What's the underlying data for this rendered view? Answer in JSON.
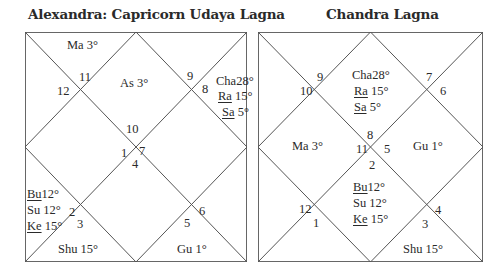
{
  "left_chart": {
    "title": "Alexandra: Capricorn Udaya Lagna",
    "house_numbers": {
      "h1": "10",
      "h2": "11",
      "h3": "12",
      "h4": "1",
      "h5": "2",
      "h6": "3",
      "h7": "4",
      "h8": "5",
      "h9": "6",
      "h10": "7",
      "h11": "8",
      "h12": "9"
    },
    "planets": {
      "ma": {
        "name": "Ma",
        "deg": "3°"
      },
      "as": {
        "name": "As",
        "deg": "3°"
      },
      "cha": {
        "name": "Cha",
        "deg": "28°"
      },
      "ra": {
        "name": "Ra",
        "deg": "15°"
      },
      "sa": {
        "name": "Sa",
        "deg": "5°"
      },
      "bu": {
        "name": "Bu",
        "deg": "12°"
      },
      "su": {
        "name": "Su",
        "deg": "12°"
      },
      "ke": {
        "name": "Ke",
        "deg": "15°"
      },
      "shu": {
        "name": "Shu",
        "deg": "15°"
      },
      "gu": {
        "name": "Gu",
        "deg": "1°"
      }
    }
  },
  "right_chart": {
    "title": "Chandra Lagna",
    "house_numbers": {
      "h1": "8",
      "h2": "9",
      "h3": "10",
      "h4": "11",
      "h5": "12",
      "h6": "1",
      "h7": "2",
      "h8": "3",
      "h9": "4",
      "h10": "5",
      "h11": "6",
      "h12": "7"
    },
    "planets": {
      "cha": {
        "name": "Cha",
        "deg": "28°"
      },
      "ra": {
        "name": "Ra",
        "deg": "15°"
      },
      "sa": {
        "name": "Sa",
        "deg": "5°"
      },
      "ma": {
        "name": "Ma",
        "deg": "3°"
      },
      "gu": {
        "name": "Gu",
        "deg": "1°"
      },
      "bu": {
        "name": "Bu",
        "deg": "12°"
      },
      "su": {
        "name": "Su",
        "deg": "12°"
      },
      "ke": {
        "name": "Ke",
        "deg": "15°"
      },
      "shu": {
        "name": "Shu",
        "deg": "15°"
      }
    }
  },
  "style": {
    "line_color": "#555555",
    "text_color": "#2a2a2a"
  }
}
